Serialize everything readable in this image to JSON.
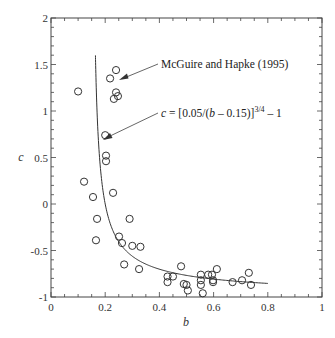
{
  "chart_data": {
    "type": "scatter",
    "title": "",
    "xlabel": "b",
    "ylabel": "c",
    "xlim": [
      0,
      1
    ],
    "ylim": [
      -1,
      2
    ],
    "grid": false,
    "x_ticks": [
      0,
      0.2,
      0.4,
      0.6,
      0.8,
      1
    ],
    "x_tick_labels": [
      "0",
      "0.2",
      "0.4",
      "0.6",
      "0.8",
      "1"
    ],
    "y_ticks": [
      -1,
      -0.5,
      0,
      0.5,
      1,
      1.5,
      2
    ],
    "y_tick_labels": [
      "-1",
      "-0.5",
      "0",
      "0.5",
      "1",
      "1.5",
      "2"
    ],
    "series": [
      {
        "name": "McGuire and Hapke (1995)",
        "type": "scatter",
        "marker": "open-circle",
        "points": [
          [
            0.1,
            1.21
          ],
          [
            0.218,
            1.35
          ],
          [
            0.24,
            1.44
          ],
          [
            0.24,
            1.2
          ],
          [
            0.247,
            1.16
          ],
          [
            0.232,
            1.13
          ],
          [
            0.2,
            0.74
          ],
          [
            0.203,
            0.52
          ],
          [
            0.203,
            0.46
          ],
          [
            0.122,
            0.24
          ],
          [
            0.155,
            0.075
          ],
          [
            0.229,
            0.12
          ],
          [
            0.17,
            -0.16
          ],
          [
            0.29,
            -0.16
          ],
          [
            0.166,
            -0.39
          ],
          [
            0.251,
            -0.35
          ],
          [
            0.262,
            -0.42
          ],
          [
            0.3,
            -0.45
          ],
          [
            0.33,
            -0.46
          ],
          [
            0.27,
            -0.65
          ],
          [
            0.325,
            -0.7
          ],
          [
            0.43,
            -0.78
          ],
          [
            0.43,
            -0.84
          ],
          [
            0.45,
            -0.78
          ],
          [
            0.48,
            -0.67
          ],
          [
            0.49,
            -0.86
          ],
          [
            0.5,
            -0.87
          ],
          [
            0.505,
            -0.93
          ],
          [
            0.553,
            -0.76
          ],
          [
            0.553,
            -0.82
          ],
          [
            0.553,
            -0.87
          ],
          [
            0.56,
            -0.96
          ],
          [
            0.58,
            -0.76
          ],
          [
            0.594,
            -0.76
          ],
          [
            0.598,
            -0.82
          ],
          [
            0.598,
            -0.84
          ],
          [
            0.612,
            -0.7
          ],
          [
            0.67,
            -0.84
          ],
          [
            0.705,
            -0.82
          ],
          [
            0.73,
            -0.74
          ],
          [
            0.738,
            -0.87
          ]
        ]
      },
      {
        "name": "c = [0.05/(b – 0.15)]^(3/4) – 1",
        "type": "line",
        "formula": "c = [0.05/(b - 0.15)]^(3/4) - 1",
        "b_range": [
          0.164,
          0.8
        ]
      }
    ],
    "annotations": [
      {
        "text": "McGuire and Hapke (1995)",
        "points_to": [
          0.22,
          1.38
        ]
      },
      {
        "text_prefix": "c",
        "text_main": " = [0.05/(",
        "text_var": "b",
        "text_tail": " – 0.15)]",
        "text_sup": "3/4",
        "text_end": " – 1",
        "points_to": [
          0.19,
          0.68
        ]
      }
    ]
  }
}
